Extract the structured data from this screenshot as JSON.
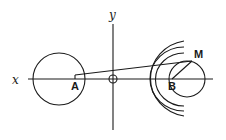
{
  "diagram": {
    "axes": {
      "x_label": "x",
      "y_label": "y"
    },
    "points": {
      "A": "A",
      "B": "B",
      "M": "M"
    },
    "elements": [
      {
        "type": "circle",
        "name": "circle-around-A",
        "center": "A"
      },
      {
        "type": "circle",
        "name": "circle-around-B",
        "center": "B",
        "passes_through": "M"
      },
      {
        "type": "circle",
        "name": "origin-circle",
        "center": "O"
      },
      {
        "type": "arc-set",
        "name": "wave-arcs",
        "count": 3,
        "center": "B"
      },
      {
        "type": "segment",
        "from": "A",
        "to": "M"
      },
      {
        "type": "segment",
        "from": "B",
        "to": "M"
      }
    ],
    "colors": {
      "stroke": "#1a1a1a",
      "background": "#ffffff"
    }
  }
}
